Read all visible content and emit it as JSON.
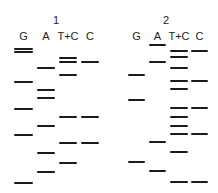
{
  "panels": [
    {
      "number": "1",
      "lanes": [
        {
          "label": "G",
          "x": 14,
          "width": 19,
          "bands": [
            49,
            52,
            82,
            109,
            135,
            183
          ]
        },
        {
          "label": "A",
          "x": 37,
          "width": 18,
          "bands": [
            68,
            90,
            98,
            126,
            153,
            172
          ]
        },
        {
          "label": "T+C",
          "x": 59,
          "width": 18,
          "bands": [
            58,
            62,
            75,
            117,
            143,
            163
          ]
        },
        {
          "label": "C",
          "x": 81,
          "width": 18,
          "bands": [
            62,
            117,
            143
          ]
        }
      ]
    },
    {
      "number": "2",
      "lanes": [
        {
          "label": "G",
          "x": 128,
          "width": 17,
          "bands": [
            75,
            100,
            162
          ]
        },
        {
          "label": "A",
          "x": 149,
          "width": 17,
          "bands": [
            45,
            62,
            142,
            171
          ]
        },
        {
          "label": "T+C",
          "x": 170,
          "width": 18,
          "bands": [
            51,
            57,
            68,
            81,
            89,
            108,
            117,
            126,
            134,
            152,
            182
          ]
        },
        {
          "label": "C",
          "x": 191,
          "width": 17,
          "bands": [
            51,
            81,
            108,
            134,
            182
          ]
        }
      ]
    }
  ],
  "colors": {
    "band": "#1a1a1a",
    "background": "#ffffff"
  }
}
